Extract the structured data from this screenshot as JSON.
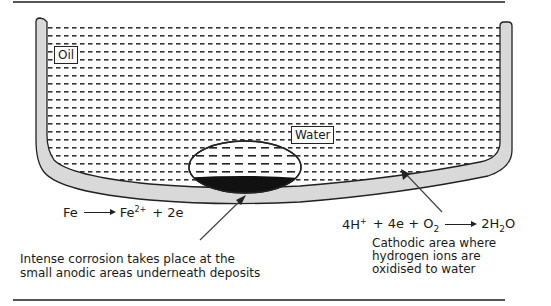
{
  "labels": {
    "oil": "Oil",
    "water": "Water"
  },
  "anodic_reaction": {
    "reactant": "Fe",
    "product_base": "Fe",
    "product_charge": "2+",
    "plus_electrons": "+ 2e"
  },
  "cathodic_reaction": {
    "part1_base": "4H",
    "part1_charge": "+",
    "part2": "+ 4e + O",
    "part2_sub": "2",
    "product_pre": "2H",
    "product_sub": "2",
    "product_post": "O"
  },
  "anodic_caption": [
    "Intense corrosion takes place at the",
    "small anodic areas underneath deposits"
  ],
  "cathodic_caption": [
    "Cathodic area where",
    "hydrogen ions are",
    "oxidised to water"
  ],
  "colors": {
    "vessel_wall": "#d9d9d9",
    "outline": "#222222",
    "deposit": "#111111",
    "rule": "#555555"
  }
}
